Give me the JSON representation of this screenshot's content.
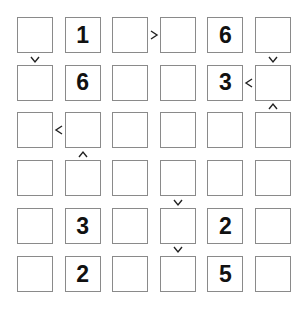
{
  "puzzle": {
    "type": "futoshiki",
    "size": 6,
    "grid": [
      [
        "",
        "1",
        "",
        "",
        "6",
        ""
      ],
      [
        "",
        "6",
        "",
        "",
        "3",
        ""
      ],
      [
        "",
        "",
        "",
        "",
        "",
        ""
      ],
      [
        "",
        "",
        "",
        "",
        "",
        ""
      ],
      [
        "",
        "3",
        "",
        "",
        "2",
        ""
      ],
      [
        "",
        "2",
        "",
        "",
        "5",
        ""
      ]
    ],
    "inequalities": [
      {
        "between": [
          [
            0,
            2
          ],
          [
            0,
            3
          ]
        ],
        "symbol": ">",
        "orientation": "horizontal"
      },
      {
        "between": [
          [
            0,
            0
          ],
          [
            1,
            0
          ]
        ],
        "symbol": "v",
        "orientation": "vertical"
      },
      {
        "between": [
          [
            0,
            5
          ],
          [
            1,
            5
          ]
        ],
        "symbol": "v",
        "orientation": "vertical"
      },
      {
        "between": [
          [
            1,
            4
          ],
          [
            1,
            5
          ]
        ],
        "symbol": "<",
        "orientation": "horizontal"
      },
      {
        "between": [
          [
            1,
            5
          ],
          [
            2,
            5
          ]
        ],
        "symbol": "^",
        "orientation": "vertical"
      },
      {
        "between": [
          [
            2,
            0
          ],
          [
            2,
            1
          ]
        ],
        "symbol": "<",
        "orientation": "horizontal"
      },
      {
        "between": [
          [
            2,
            1
          ],
          [
            3,
            1
          ]
        ],
        "symbol": "^",
        "orientation": "vertical"
      },
      {
        "between": [
          [
            3,
            3
          ],
          [
            4,
            3
          ]
        ],
        "symbol": "v",
        "orientation": "vertical"
      },
      {
        "between": [
          [
            4,
            3
          ],
          [
            5,
            3
          ]
        ],
        "symbol": "v",
        "orientation": "vertical"
      }
    ]
  }
}
